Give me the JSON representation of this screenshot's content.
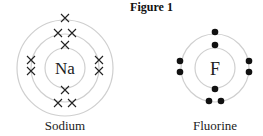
{
  "figure": {
    "title": "Figure 1",
    "atoms": [
      {
        "symbol": "Na",
        "name": "Sodium",
        "shells": [
          2,
          8,
          1
        ],
        "electron_marker": "cross"
      },
      {
        "symbol": "F",
        "name": "Fluorine",
        "shells": [
          2,
          7
        ],
        "electron_marker": "dot"
      }
    ]
  },
  "colors": {
    "ring": "#cfcfcf",
    "text": "#222222",
    "marker": "#111111"
  }
}
